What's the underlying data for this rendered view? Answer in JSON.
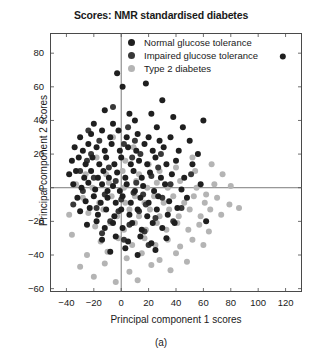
{
  "chart_data": {
    "type": "scatter",
    "title": "Scores: NMR standardised diabetes",
    "xlabel": "Principal component 1 scores",
    "ylabel": "Principal component 2 scores",
    "caption": "(a)",
    "xlim": [
      -52,
      132
    ],
    "ylim": [
      -62,
      92
    ],
    "xticks": [
      -40,
      -20,
      0,
      20,
      40,
      60,
      80,
      100,
      120
    ],
    "yticks": [
      -60,
      -40,
      -20,
      0,
      20,
      40,
      60,
      80
    ],
    "xtick_labels": [
      "−40",
      "−20",
      "0",
      "20",
      "40",
      "60",
      "80",
      "100",
      "120"
    ],
    "ytick_labels": [
      "−60",
      "−40",
      "−20",
      "0",
      "20",
      "40",
      "60",
      "80"
    ],
    "grid": false,
    "reference_lines": {
      "x": 0,
      "y": 0,
      "color": "#6b6b6b"
    },
    "legend_position": "top-center",
    "marker_size_px": 6,
    "series": [
      {
        "name": "Normal glucose tolerance",
        "color": "#1f1f1f",
        "points": [
          [
            -3,
            68
          ],
          [
            1,
            60
          ],
          [
            18,
            62
          ],
          [
            30,
            52
          ],
          [
            -12,
            46
          ],
          [
            6,
            44
          ],
          [
            22,
            44
          ],
          [
            38,
            42
          ],
          [
            -20,
            38
          ],
          [
            -6,
            38
          ],
          [
            10,
            40
          ],
          [
            26,
            36
          ],
          [
            45,
            36
          ],
          [
            60,
            40
          ],
          [
            -30,
            30
          ],
          [
            -22,
            32
          ],
          [
            -14,
            34
          ],
          [
            -8,
            30
          ],
          [
            -2,
            34
          ],
          [
            4,
            30
          ],
          [
            12,
            32
          ],
          [
            20,
            30
          ],
          [
            28,
            28
          ],
          [
            36,
            30
          ],
          [
            50,
            28
          ],
          [
            118,
            78
          ],
          [
            -34,
            24
          ],
          [
            -28,
            22
          ],
          [
            -24,
            26
          ],
          [
            -18,
            24
          ],
          [
            -12,
            22
          ],
          [
            -7,
            26
          ],
          [
            -1,
            22
          ],
          [
            5,
            24
          ],
          [
            11,
            22
          ],
          [
            17,
            26
          ],
          [
            23,
            22
          ],
          [
            31,
            24
          ],
          [
            42,
            22
          ],
          [
            56,
            20
          ],
          [
            -36,
            16
          ],
          [
            -31,
            18
          ],
          [
            -26,
            14
          ],
          [
            -21,
            18
          ],
          [
            -16,
            14
          ],
          [
            -11,
            18
          ],
          [
            -5,
            14
          ],
          [
            0,
            18
          ],
          [
            7,
            14
          ],
          [
            13,
            16
          ],
          [
            19,
            14
          ],
          [
            25,
            18
          ],
          [
            33,
            14
          ],
          [
            40,
            16
          ],
          [
            52,
            14
          ],
          [
            -38,
            8
          ],
          [
            -33,
            10
          ],
          [
            -27,
            6
          ],
          [
            -22,
            10
          ],
          [
            -17,
            6
          ],
          [
            -13,
            10
          ],
          [
            -9,
            6
          ],
          [
            -3,
            9
          ],
          [
            3,
            6
          ],
          [
            9,
            10
          ],
          [
            15,
            6
          ],
          [
            21,
            9
          ],
          [
            29,
            6
          ],
          [
            37,
            8
          ],
          [
            46,
            6
          ],
          [
            -35,
            2
          ],
          [
            -29,
            0
          ],
          [
            -24,
            3
          ],
          [
            -19,
            -1
          ],
          [
            -14,
            2
          ],
          [
            -10,
            -2
          ],
          [
            -6,
            1
          ],
          [
            -1,
            -2
          ],
          [
            4,
            2
          ],
          [
            10,
            -2
          ],
          [
            16,
            1
          ],
          [
            24,
            -2
          ],
          [
            32,
            2
          ],
          [
            44,
            -1
          ],
          [
            58,
            2
          ],
          [
            -32,
            -6
          ],
          [
            -26,
            -8
          ],
          [
            -20,
            -5
          ],
          [
            -15,
            -9
          ],
          [
            -10,
            -6
          ],
          [
            -4,
            -9
          ],
          [
            1,
            -5
          ],
          [
            7,
            -9
          ],
          [
            14,
            -6
          ],
          [
            20,
            -9
          ],
          [
            27,
            -5
          ],
          [
            35,
            -8
          ],
          [
            48,
            -6
          ],
          [
            -30,
            -14
          ],
          [
            -23,
            -12
          ],
          [
            -17,
            -16
          ],
          [
            -11,
            -13
          ],
          [
            -5,
            -17
          ],
          [
            0,
            -13
          ],
          [
            6,
            -16
          ],
          [
            12,
            -13
          ],
          [
            19,
            -17
          ],
          [
            26,
            -13
          ],
          [
            34,
            -16
          ],
          [
            41,
            -12
          ],
          [
            -25,
            -22
          ],
          [
            -18,
            -20
          ],
          [
            -12,
            -24
          ],
          [
            -6,
            -21
          ],
          [
            1,
            -24
          ],
          [
            8,
            -21
          ],
          [
            15,
            -25
          ],
          [
            23,
            -21
          ],
          [
            30,
            -24
          ],
          [
            39,
            -21
          ],
          [
            62,
            -20
          ],
          [
            -14,
            -31
          ],
          [
            -4,
            -29
          ],
          [
            5,
            -32
          ],
          [
            14,
            -29
          ],
          [
            22,
            -33
          ],
          [
            33,
            -30
          ],
          [
            -8,
            -38
          ],
          [
            3,
            -36
          ],
          [
            12,
            -40
          ],
          [
            25,
            -37
          ]
        ]
      },
      {
        "name": "Impaired glucose tolerance",
        "color": "#383838",
        "points": [
          [
            -16,
            28
          ],
          [
            2,
            26
          ],
          [
            14,
            20
          ],
          [
            -25,
            16
          ],
          [
            -9,
            12
          ],
          [
            8,
            18
          ],
          [
            27,
            12
          ],
          [
            -20,
            6
          ],
          [
            -4,
            4
          ],
          [
            11,
            3
          ],
          [
            22,
            7
          ],
          [
            36,
            2
          ],
          [
            -28,
            -2
          ],
          [
            -12,
            -4
          ],
          [
            0,
            -7
          ],
          [
            9,
            -3
          ],
          [
            18,
            -10
          ],
          [
            30,
            -6
          ],
          [
            -18,
            -12
          ],
          [
            -2,
            -14
          ],
          [
            13,
            -14
          ],
          [
            25,
            -18
          ],
          [
            -8,
            -20
          ],
          [
            6,
            -22
          ],
          [
            17,
            -26
          ],
          [
            -14,
            -27
          ],
          [
            2,
            -31
          ],
          [
            20,
            -34
          ],
          [
            44,
            -12
          ],
          [
            51,
            8
          ],
          [
            -22,
            20
          ],
          [
            5,
            36
          ],
          [
            -30,
            10
          ],
          [
            38,
            -20
          ],
          [
            29,
            20
          ],
          [
            -6,
            48
          ],
          [
            16,
            -4
          ],
          [
            -35,
            -10
          ],
          [
            10,
            28
          ],
          [
            -24,
            34
          ]
        ]
      },
      {
        "name": "Type 2 diabetes",
        "color": "#b4b4b4",
        "points": [
          [
            -6,
            30
          ],
          [
            9,
            24
          ],
          [
            -18,
            18
          ],
          [
            3,
            16
          ],
          [
            20,
            14
          ],
          [
            -26,
            8
          ],
          [
            -11,
            8
          ],
          [
            1,
            10
          ],
          [
            13,
            8
          ],
          [
            28,
            10
          ],
          [
            40,
            12
          ],
          [
            54,
            10
          ],
          [
            66,
            14
          ],
          [
            74,
            8
          ],
          [
            -33,
            2
          ],
          [
            -21,
            0
          ],
          [
            -9,
            3
          ],
          [
            2,
            0
          ],
          [
            11,
            4
          ],
          [
            19,
            0
          ],
          [
            26,
            3
          ],
          [
            34,
            0
          ],
          [
            43,
            4
          ],
          [
            55,
            0
          ],
          [
            68,
            2
          ],
          [
            80,
            1
          ],
          [
            -28,
            -6
          ],
          [
            -16,
            -9
          ],
          [
            -7,
            -5
          ],
          [
            3,
            -9
          ],
          [
            10,
            -5
          ],
          [
            17,
            -9
          ],
          [
            24,
            -5
          ],
          [
            31,
            -9
          ],
          [
            38,
            -5
          ],
          [
            46,
            -9
          ],
          [
            53,
            -5
          ],
          [
            61,
            -9
          ],
          [
            70,
            -6
          ],
          [
            79,
            -10
          ],
          [
            -24,
            -15
          ],
          [
            -13,
            -13
          ],
          [
            -3,
            -17
          ],
          [
            6,
            -13
          ],
          [
            13,
            -17
          ],
          [
            21,
            -13
          ],
          [
            28,
            -17
          ],
          [
            35,
            -13
          ],
          [
            42,
            -17
          ],
          [
            50,
            -13
          ],
          [
            58,
            -17
          ],
          [
            65,
            -13
          ],
          [
            73,
            -16
          ],
          [
            -19,
            -23
          ],
          [
            -8,
            -21
          ],
          [
            2,
            -25
          ],
          [
            10,
            -21
          ],
          [
            18,
            -25
          ],
          [
            26,
            -21
          ],
          [
            33,
            -25
          ],
          [
            41,
            -21
          ],
          [
            49,
            -25
          ],
          [
            57,
            -22
          ],
          [
            64,
            -26
          ],
          [
            -15,
            -32
          ],
          [
            -2,
            -30
          ],
          [
            8,
            -34
          ],
          [
            17,
            -30
          ],
          [
            25,
            -34
          ],
          [
            34,
            -31
          ],
          [
            43,
            -35
          ],
          [
            52,
            -31
          ],
          [
            60,
            -34
          ],
          [
            -25,
            -40
          ],
          [
            -10,
            -38
          ],
          [
            4,
            -42
          ],
          [
            15,
            -39
          ],
          [
            28,
            -43
          ],
          [
            40,
            -39
          ],
          [
            -30,
            -47
          ],
          [
            -12,
            -45
          ],
          [
            6,
            -50
          ],
          [
            22,
            -46
          ],
          [
            36,
            -49
          ],
          [
            -20,
            -53
          ],
          [
            12,
            -55
          ],
          [
            48,
            -44
          ],
          [
            -4,
            -56
          ],
          [
            -38,
            -16
          ],
          [
            -36,
            -28
          ],
          [
            52,
            18
          ],
          [
            62,
            -4
          ],
          [
            86,
            -12
          ]
        ]
      }
    ]
  }
}
